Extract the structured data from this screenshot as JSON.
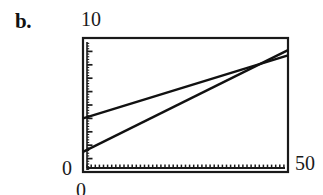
{
  "figure": {
    "panel_label": "b.",
    "background_color": "#ffffff",
    "ink_color": "#1a1a1a"
  },
  "chart_data": {
    "type": "line",
    "title": "",
    "subtitle": "",
    "xlabel": "",
    "ylabel": "",
    "xlim": [
      0,
      50
    ],
    "ylim": [
      0,
      10
    ],
    "x_tick_labels": [
      "0",
      "50"
    ],
    "y_tick_labels": [
      "0",
      "10"
    ],
    "x_tick_min": "0",
    "x_tick_max": "50",
    "y_tick_min": "0",
    "y_tick_max": "10",
    "grid": false,
    "legend": null,
    "frame": "box",
    "tick_direction": "in",
    "y_major_ticks": [
      0,
      1,
      2,
      3,
      4,
      5,
      6,
      7,
      8,
      9,
      10
    ],
    "y_minor_tick_count": 50,
    "x_minor_tick_count": 50,
    "series": [
      {
        "name": "upper-line",
        "x": [
          0,
          50
        ],
        "values": [
          4.0,
          8.7
        ],
        "style": "solid",
        "color": "#111111"
      },
      {
        "name": "lower-line",
        "x": [
          0,
          50
        ],
        "values": [
          1.5,
          9.1
        ],
        "style": "solid",
        "color": "#111111"
      }
    ],
    "intersection": {
      "x": 40,
      "y": 7.8
    },
    "annotations": []
  }
}
